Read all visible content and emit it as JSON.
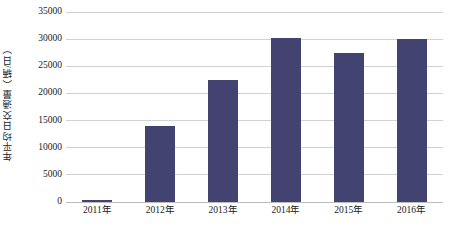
{
  "chart_data": {
    "type": "bar",
    "title": "",
    "subtitle": "",
    "xlabel": "",
    "ylabel": "年平均日交通量（辆/日）",
    "categories": [
      "2011年",
      "2012年",
      "2013年",
      "2014年",
      "2015年",
      "2016年"
    ],
    "values": [
      400,
      14000,
      22500,
      30300,
      27400,
      30100
    ],
    "series": [
      {
        "name": "年平均日交通量",
        "values": [
          400,
          14000,
          22500,
          30300,
          27400,
          30100
        ]
      }
    ],
    "ylim": [
      0,
      35000
    ],
    "ytick_values": [
      0,
      5000,
      10000,
      15000,
      20000,
      25000,
      30000,
      35000
    ],
    "ytick_labels": [
      "0",
      "5000",
      "10000",
      "15000",
      "20000",
      "25000",
      "30000",
      "35000"
    ],
    "grid": "horizontal",
    "legend": "none",
    "bar_color": "#434371",
    "gridline_color": "#d2d2d2",
    "background_color": "#ffffff"
  }
}
